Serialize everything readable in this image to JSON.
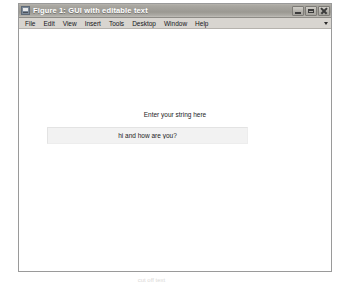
{
  "window": {
    "title": "Figure 1: GUI with editable text",
    "icon": "figure-icon",
    "controls": [
      {
        "name": "minimize",
        "label": "Minimize"
      },
      {
        "name": "maximize",
        "label": "Maximize"
      },
      {
        "name": "close",
        "label": "Close"
      }
    ],
    "frame_color": "#d6d3ce",
    "titlebar_color": "#9f9d97",
    "canvas_color": "#ffffff"
  },
  "menu": {
    "items": [
      {
        "label": "File"
      },
      {
        "label": "Edit"
      },
      {
        "label": "View"
      },
      {
        "label": "Insert"
      },
      {
        "label": "Tools"
      },
      {
        "label": "Desktop"
      },
      {
        "label": "Window"
      },
      {
        "label": "Help"
      }
    ],
    "overflow_icon": "chevron-down-icon"
  },
  "figure": {
    "prompt_label": "Enter your string here",
    "input": {
      "value": "hi and how are you?",
      "placeholder": "Enter your string here"
    }
  },
  "artifact": {
    "text": "cut off text"
  }
}
